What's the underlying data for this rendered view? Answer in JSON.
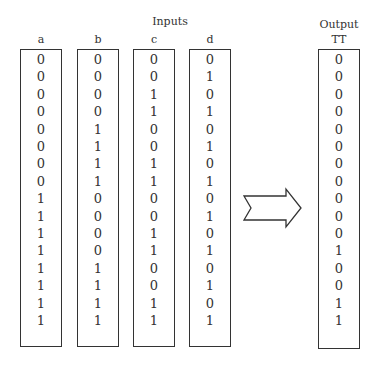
{
  "title_inputs": "Inputs",
  "title_output": "Output",
  "columns": [
    {
      "label": "a",
      "values": [
        "0",
        "0",
        "0",
        "0",
        "0",
        "0",
        "0",
        "0",
        "1",
        "1",
        "1",
        "1",
        "1",
        "1",
        "1",
        "1"
      ]
    },
    {
      "label": "b",
      "values": [
        "0",
        "0",
        "0",
        "0",
        "1",
        "1",
        "1",
        "1",
        "0",
        "0",
        "0",
        "0",
        "1",
        "1",
        "1",
        "1"
      ]
    },
    {
      "label": "c",
      "values": [
        "0",
        "0",
        "1",
        "1",
        "0",
        "0",
        "1",
        "1",
        "0",
        "0",
        "1",
        "1",
        "0",
        "0",
        "1",
        "1"
      ]
    },
    {
      "label": "d",
      "values": [
        "0",
        "1",
        "0",
        "1",
        "0",
        "1",
        "0",
        "1",
        "0",
        "1",
        "0",
        "1",
        "0",
        "1",
        "0",
        "1"
      ]
    }
  ],
  "output": {
    "label": "TT",
    "values": [
      "0",
      "0",
      "0",
      "0",
      "0",
      "0",
      "0",
      "0",
      "0",
      "0",
      "0",
      "1",
      "0",
      "0",
      "1",
      "1"
    ]
  },
  "arrow": {
    "icon": "right-arrow-icon"
  }
}
